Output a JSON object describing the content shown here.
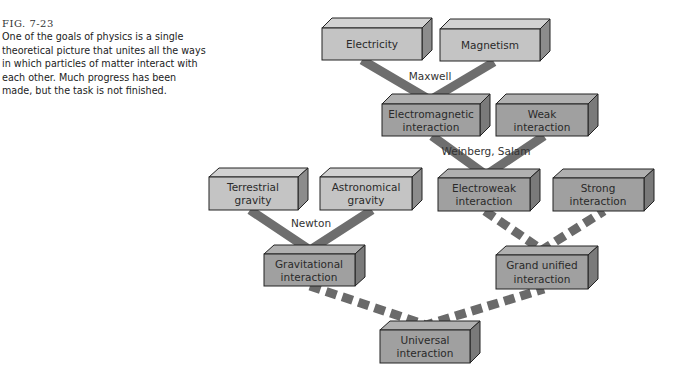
{
  "caption": {
    "figure_number": "FIG. 7-23",
    "text": "One of the goals of physics is a single theoretical picture that unites all the ways in which particles of matter interact with each other. Much progress has been made, but the task is not finished."
  },
  "colors": {
    "light_box": "#c4c4c4",
    "dark_box": "#9a9a9a",
    "solid_connector": "#6e6e6e",
    "dashed_connector": "#6a6a6a"
  },
  "boxes": {
    "electricity": {
      "line1": "Electricity",
      "line2": ""
    },
    "magnetism": {
      "line1": "Magnetism",
      "line2": ""
    },
    "electromagnetic": {
      "line1": "Electromagnetic",
      "line2": "interaction"
    },
    "weak": {
      "line1": "Weak",
      "line2": "interaction"
    },
    "terrestrial": {
      "line1": "Terrestrial",
      "line2": "gravity"
    },
    "astronomical": {
      "line1": "Astronomical",
      "line2": "gravity"
    },
    "electroweak": {
      "line1": "Electroweak",
      "line2": "interaction"
    },
    "strong": {
      "line1": "Strong",
      "line2": "interaction"
    },
    "gravitational": {
      "line1": "Gravitational",
      "line2": "interaction"
    },
    "grand_unified": {
      "line1": "Grand unified",
      "line2": "interaction"
    },
    "universal": {
      "line1": "Universal",
      "line2": "interaction"
    }
  },
  "connector_labels": {
    "maxwell": "Maxwell",
    "weinberg_salam": "Weinberg, Salam",
    "newton": "Newton"
  }
}
